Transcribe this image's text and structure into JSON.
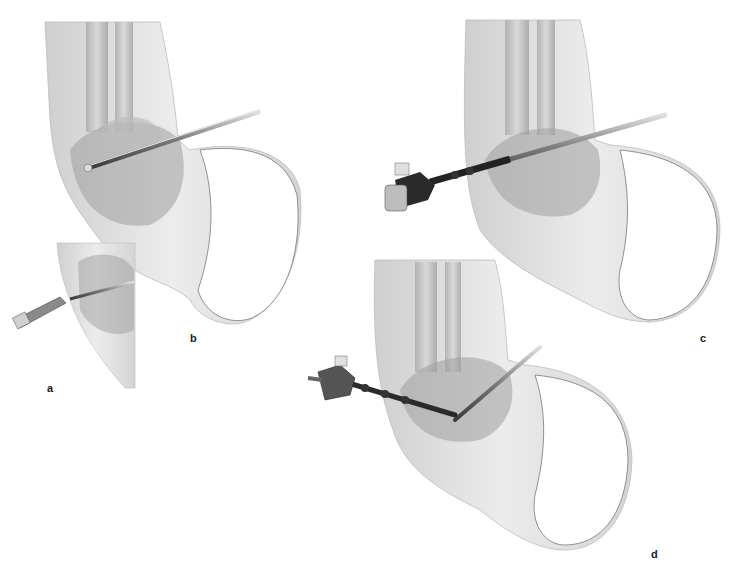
{
  "figure": {
    "panels": [
      {
        "id": "a",
        "label": "a",
        "description": "Inset: portal created with blade, cannula inserted"
      },
      {
        "id": "b",
        "label": "b",
        "description": "Trocar/cannula inserted into ankle joint"
      },
      {
        "id": "c",
        "label": "c",
        "description": "Arthroscope inserted through cannula"
      },
      {
        "id": "d",
        "label": "d",
        "description": "Arthroscope with instrument in joint"
      }
    ]
  },
  "colors": {
    "background": "#ffffff",
    "skin": "#e4e4e4",
    "skin_shadow": "#b8b8b8",
    "bone": "#c9c9c9",
    "tissue": "#9a9a9a",
    "instrument_dark": "#2a2a2a",
    "instrument_steel": "#8c8c8c",
    "label_text": "#1a1a1a"
  }
}
